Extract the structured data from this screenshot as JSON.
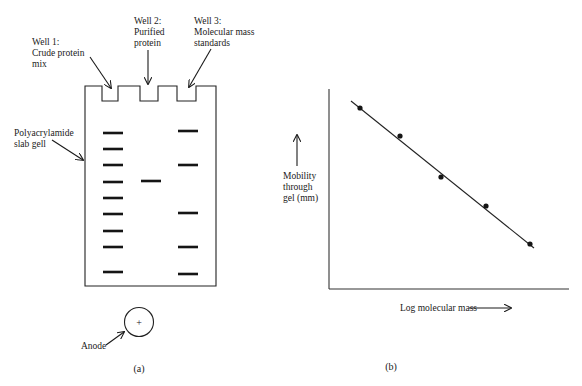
{
  "panel_a": {
    "caption": "(a)",
    "well1_label": [
      "Well 1:",
      "Crude protein",
      "mix"
    ],
    "well2_label": [
      "Well 2:",
      "Purified",
      "protein"
    ],
    "well3_label": [
      "Well 3:",
      "Molecular mass",
      "standards"
    ],
    "gel_label": [
      "Polyacrylamide",
      "slab gell"
    ],
    "anode_label": "Anode",
    "anode_symbol": "+",
    "lanes": [
      {
        "name": "crude-protein-mix",
        "band_y": [
          133,
          149,
          165,
          182,
          198,
          214,
          231,
          247,
          272
        ]
      },
      {
        "name": "purified-protein",
        "band_y": [
          181
        ]
      },
      {
        "name": "molecular-mass-standards",
        "band_y": [
          131,
          165,
          213,
          247,
          274
        ]
      }
    ]
  },
  "panel_b": {
    "caption": "(b)",
    "ylabel": [
      "Mobility",
      "through",
      "gel (mm)"
    ],
    "xlabel": "Log molecular mass"
  },
  "chart_data": {
    "type": "scatter",
    "title": "",
    "xlabel": "Log molecular mass",
    "ylabel": "Mobility through gel (mm)",
    "grid": false,
    "ticks": "none",
    "series": [
      {
        "name": "Molecular mass standards",
        "x": [
          1,
          2,
          3,
          4,
          5
        ],
        "y": [
          5,
          4,
          3,
          2,
          1
        ],
        "pixel_points": [
          [
            360,
            108
          ],
          [
            400,
            136
          ],
          [
            441,
            177
          ],
          [
            486,
            206
          ],
          [
            530,
            244
          ]
        ]
      }
    ],
    "fit_line": {
      "type": "linear",
      "pixel_from": [
        351,
        101
      ],
      "pixel_to": [
        534,
        248
      ],
      "trend": "decreasing"
    }
  }
}
